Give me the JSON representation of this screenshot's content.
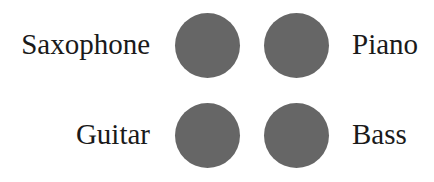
{
  "items": [
    {
      "label": "Saxophone",
      "position": "top-left"
    },
    {
      "label": "Piano",
      "position": "top-right"
    },
    {
      "label": "Guitar",
      "position": "bottom-left"
    },
    {
      "label": "Bass",
      "position": "bottom-right"
    }
  ],
  "colors": {
    "dot": "#666666",
    "text": "#1a1a1a",
    "background": "#ffffff"
  }
}
